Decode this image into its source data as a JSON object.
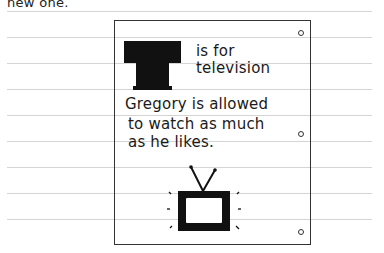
{
  "page": {
    "top_text": "new one."
  },
  "card": {
    "big_letter": "T",
    "heading_line1": "is for",
    "heading_line2": "television",
    "body_line1": "Gregory is allowed",
    "body_line2": "to watch as much",
    "body_line3": "as he likes.",
    "illustration": "television-icon"
  },
  "colors": {
    "ink": "#1a1a1a",
    "rule": "#d4d4d4",
    "paper": "#ffffff"
  }
}
